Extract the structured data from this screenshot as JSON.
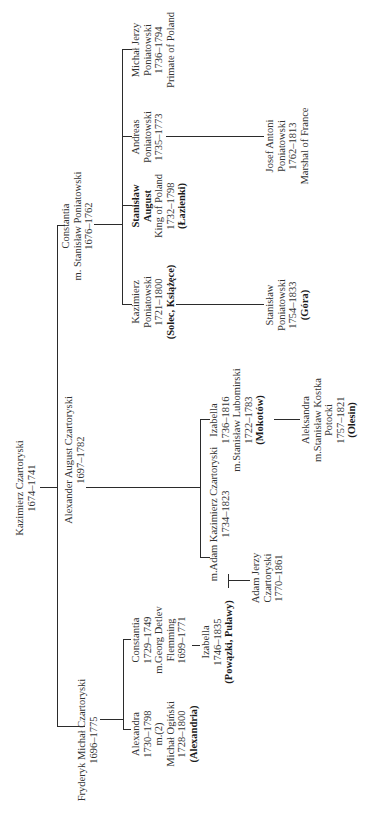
{
  "persons": {
    "kazimierz_czartoryski": {
      "lines": [
        "Kazimierz Czartoryski",
        "1674–1741"
      ]
    },
    "constantia_gen1": {
      "lines": [
        "Constantia",
        "m. Stanisław Poniatowski",
        "1676–1762"
      ]
    },
    "alexander_august": {
      "lines": [
        "Alexander August Czartoryski",
        "1697–1782"
      ]
    },
    "fryderyk_michal": {
      "lines": [
        "Fryderyk Michał Czartoryski",
        "1696–1775"
      ]
    },
    "kazimierz_poniatowski": {
      "lines": [
        "Kazimierz",
        "Poniatowski",
        "1721–1800"
      ],
      "estate": "(Solec, Książęce)"
    },
    "stanislaw_august": {
      "bold_lines": [
        "Stanisław",
        "August"
      ],
      "lines": [
        "King of Poland",
        "1732–1798"
      ],
      "estate": "(Łazienki)"
    },
    "andreas_poniatowski": {
      "lines": [
        "Andreas",
        "Poniatowski",
        "1735–1773"
      ]
    },
    "michal_jerzy": {
      "lines": [
        "Michał Jerzy",
        "Poniatowski",
        "1736–1794",
        "Primate of Poland"
      ]
    },
    "stanislaw_poniatowski": {
      "lines": [
        "Stanisław",
        "Poniatowski",
        "1754–1833"
      ],
      "estate": "(Góra)"
    },
    "josef_antoni": {
      "lines": [
        "Josef Antoni",
        "Poniatowski",
        "1762–1813",
        "Marshal of France"
      ]
    },
    "izabella_lubomirska": {
      "lines": [
        "Izabella",
        "1736–1816",
        "m.Stanisław Lubomirski",
        "1722–1783"
      ],
      "estate": "(Mokotów)"
    },
    "adam_kazimierz": {
      "lines": [
        "m.Adam Kazimierz Czartoryski",
        "1734–1823"
      ]
    },
    "aleksandra_potocka": {
      "lines": [
        "Aleksandra",
        "m.Stanisław Kostka",
        "Potocki",
        "1757–1821"
      ],
      "estate": "(Olesin)"
    },
    "izabella_czartoryska": {
      "lines": [
        "Izabella",
        "1746–1835"
      ],
      "estate": "(Powązki, Puławy)"
    },
    "adam_jerzy": {
      "lines": [
        "Adam Jerzy",
        "Czartoryski",
        "1770–1861"
      ]
    },
    "constantia_flemming": {
      "lines": [
        "Constantia",
        "1729–1749",
        "m.Georg Detlev",
        "Flemming",
        "1699–1771"
      ]
    },
    "alexandra_oginska": {
      "lines": [
        "Alexandra",
        "1730–1798",
        "m.(2)",
        "Michał Ogiński",
        "1728–1800"
      ],
      "estate": "(Alexandria)"
    }
  }
}
